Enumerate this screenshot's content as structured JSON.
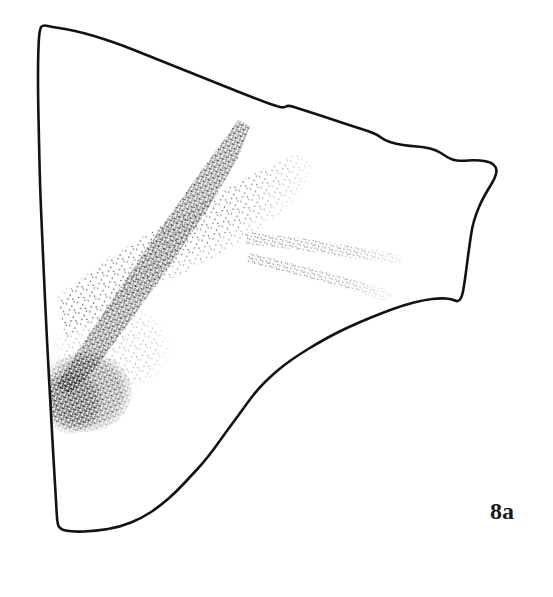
{
  "figure": {
    "label": "8a",
    "caption_text": "8a",
    "background_color": "#ffffff",
    "outline_color": "#121212",
    "stipple_color": "#2b2b2b",
    "canvas": {
      "width": 553,
      "height": 597
    }
  },
  "outline": {
    "name": "fragment-outline",
    "description": "irregular triangular slab edge",
    "stroke_width": 2.6,
    "vertices": [
      [
        41,
        27
      ],
      [
        39,
        34
      ],
      [
        38,
        60
      ],
      [
        38,
        96
      ],
      [
        39,
        140
      ],
      [
        40,
        186
      ],
      [
        42,
        232
      ],
      [
        44,
        278
      ],
      [
        46,
        320
      ],
      [
        48,
        360
      ],
      [
        50,
        396
      ],
      [
        52,
        432
      ],
      [
        54,
        468
      ],
      [
        56,
        500
      ],
      [
        57,
        520
      ],
      [
        59,
        529
      ],
      [
        72,
        532
      ],
      [
        96,
        531
      ],
      [
        120,
        527
      ],
      [
        142,
        518
      ],
      [
        160,
        506
      ],
      [
        176,
        492
      ],
      [
        190,
        477
      ],
      [
        203,
        463
      ],
      [
        214,
        449
      ],
      [
        226,
        432
      ],
      [
        238,
        416
      ],
      [
        248,
        402
      ],
      [
        258,
        389
      ],
      [
        270,
        377
      ],
      [
        284,
        365
      ],
      [
        300,
        354
      ],
      [
        318,
        343
      ],
      [
        338,
        332
      ],
      [
        360,
        322
      ],
      [
        382,
        313
      ],
      [
        404,
        305
      ],
      [
        424,
        300
      ],
      [
        440,
        298
      ],
      [
        452,
        299
      ],
      [
        458,
        302
      ],
      [
        462,
        297
      ],
      [
        464,
        286
      ],
      [
        466,
        272
      ],
      [
        468,
        256
      ],
      [
        470,
        242
      ],
      [
        472,
        228
      ],
      [
        476,
        214
      ],
      [
        482,
        200
      ],
      [
        489,
        188
      ],
      [
        495,
        178
      ],
      [
        497,
        170
      ],
      [
        494,
        164
      ],
      [
        486,
        161
      ],
      [
        474,
        160
      ],
      [
        462,
        161
      ],
      [
        452,
        160
      ],
      [
        444,
        155
      ],
      [
        436,
        150
      ],
      [
        424,
        147
      ],
      [
        410,
        146
      ],
      [
        396,
        144
      ],
      [
        384,
        140
      ],
      [
        378,
        135
      ],
      [
        368,
        131
      ],
      [
        352,
        126
      ],
      [
        334,
        120
      ],
      [
        316,
        114
      ],
      [
        300,
        109
      ],
      [
        288,
        105
      ],
      [
        284,
        108
      ],
      [
        276,
        106
      ],
      [
        262,
        101
      ],
      [
        244,
        94
      ],
      [
        224,
        86
      ],
      [
        204,
        78
      ],
      [
        184,
        70
      ],
      [
        164,
        62
      ],
      [
        144,
        54
      ],
      [
        124,
        46
      ],
      [
        104,
        39
      ],
      [
        84,
        33
      ],
      [
        66,
        29
      ],
      [
        52,
        27
      ],
      [
        44,
        25
      ],
      [
        41,
        27
      ]
    ]
  },
  "stipple_fields": [
    {
      "name": "upper-light-band",
      "tone": "light",
      "description": "broad lightly stippled band sweeping from lower-left up to the right"
    },
    {
      "name": "right-thin-band",
      "tone": "light",
      "description": "two thin stippled lines fanning toward the right edge"
    },
    {
      "name": "central-dense-stripe",
      "tone": "dark",
      "description": "dense dark diagonal stripe from upper-middle down to lower-left"
    },
    {
      "name": "lower-left-dense-patch",
      "tone": "dark",
      "description": "dense dark stipple concentration near the left edge"
    }
  ]
}
